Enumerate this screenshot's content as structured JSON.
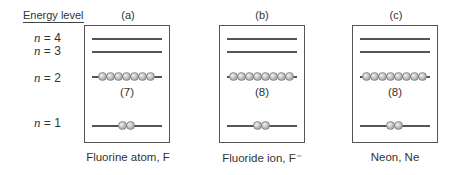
{
  "axis": {
    "title": "Energy level",
    "levels": [
      {
        "n_label": "n",
        "eq": " = 4"
      },
      {
        "n_label": "n",
        "eq": " = 3"
      },
      {
        "n_label": "n",
        "eq": " = 2"
      },
      {
        "n_label": "n",
        "eq": " = 1"
      }
    ]
  },
  "panels": [
    {
      "letter": "(a)",
      "n2_count_label": "(7)",
      "n2_electrons": 7,
      "n1_electrons": 2,
      "caption": "Fluorine atom, F"
    },
    {
      "letter": "(b)",
      "n2_count_label": "(8)",
      "n2_electrons": 8,
      "n1_electrons": 2,
      "caption": "Fluoride ion, F⁻"
    },
    {
      "letter": "(c)",
      "n2_count_label": "(8)",
      "n2_electrons": 8,
      "n1_electrons": 2,
      "caption": "Neon, Ne"
    }
  ],
  "colors": {
    "line": "#555555",
    "electron": "#b8b8b8"
  }
}
